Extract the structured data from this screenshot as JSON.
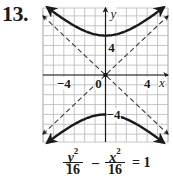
{
  "problem": {
    "number": "13."
  },
  "equation": {
    "term1": {
      "numerator_var": "y",
      "numerator_exp": "2",
      "denominator": "16"
    },
    "operator": "–",
    "term2": {
      "numerator_var": "x",
      "numerator_exp": "2",
      "denominator": "16"
    },
    "rhs": "= 1"
  },
  "colors": {
    "curve": "#1a1a1a",
    "grid": "#b8b8b8",
    "axis": "#1a1a1a",
    "asymptote": "#3a3a3a"
  },
  "chart_data": {
    "type": "line",
    "title": "",
    "xlabel": "x",
    "ylabel": "y",
    "xlim": [
      -6,
      6
    ],
    "ylim": [
      -6.8,
      6.8
    ],
    "grid": true,
    "grid_step": 1,
    "tick_labels": {
      "x": [
        {
          "value": -4,
          "label": "−4"
        },
        {
          "value": 0,
          "label": "0"
        },
        {
          "value": 4,
          "label": "4"
        }
      ],
      "y": [
        {
          "value": 4,
          "label": "4"
        },
        {
          "value": -4,
          "label": "−4"
        }
      ]
    },
    "equation": "y^2/16 - x^2/16 = 1",
    "series": [
      {
        "name": "upper branch",
        "style": "solid",
        "function": "y = sqrt(16 + x^2)",
        "x": [
          -5.6,
          -4,
          -2,
          0,
          2,
          4,
          5.6
        ],
        "y": [
          6.88,
          5.66,
          4.47,
          4,
          4.47,
          5.66,
          6.88
        ]
      },
      {
        "name": "lower branch",
        "style": "solid",
        "function": "y = -sqrt(16 + x^2)",
        "x": [
          -5.6,
          -4,
          -2,
          0,
          2,
          4,
          5.6
        ],
        "y": [
          -6.88,
          -5.66,
          -4.47,
          -4,
          -4.47,
          -5.66,
          -6.88
        ]
      },
      {
        "name": "asymptote y = x",
        "style": "dashed",
        "x": [
          -6,
          6
        ],
        "y": [
          -6,
          6
        ]
      },
      {
        "name": "asymptote y = -x",
        "style": "dashed",
        "x": [
          -6,
          6
        ],
        "y": [
          6,
          -6
        ]
      }
    ],
    "vertices": [
      {
        "x": 0,
        "y": 4
      },
      {
        "x": 0,
        "y": -4
      }
    ],
    "center": {
      "x": 0,
      "y": 0
    }
  }
}
